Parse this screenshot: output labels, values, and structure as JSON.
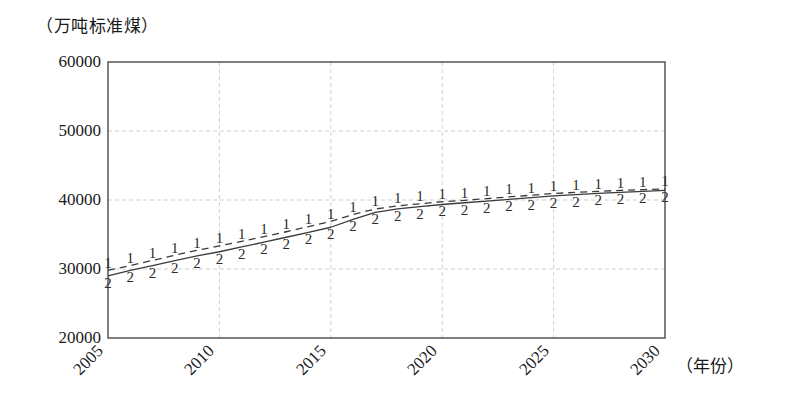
{
  "chart_data": {
    "type": "line",
    "title": "",
    "subtitle": "",
    "ylabel": "（万吨标准煤）",
    "xlabel": "（年份）",
    "xlim": [
      2005,
      2030
    ],
    "ylim": [
      20000,
      60000
    ],
    "yticks": [
      20000,
      30000,
      40000,
      50000,
      60000
    ],
    "ytick_labels": [
      "20000",
      "30000",
      "40000",
      "50000",
      "60000"
    ],
    "xticks": [
      2005,
      2010,
      2015,
      2020,
      2025,
      2030
    ],
    "xtick_labels": [
      "2005",
      "2010",
      "2015",
      "2020",
      "2025",
      "2030"
    ],
    "grid": {
      "horizontal": true,
      "vertical": true,
      "style": "dashed",
      "color": "#c9c9c9"
    },
    "legend": {
      "visible": false,
      "position": "none"
    },
    "annotations": [],
    "x": [
      2005,
      2006,
      2007,
      2008,
      2009,
      2010,
      2011,
      2012,
      2013,
      2014,
      2015,
      2016,
      2017,
      2018,
      2019,
      2020,
      2021,
      2022,
      2023,
      2024,
      2025,
      2026,
      2027,
      2028,
      2029,
      2030
    ],
    "series": [
      {
        "name": "1",
        "marker": "1",
        "linestyle": "dashed",
        "color": "#3a3a3a",
        "values": [
          29800,
          30500,
          31250,
          32000,
          32700,
          33350,
          34000,
          34700,
          35400,
          36150,
          36900,
          37900,
          38700,
          39150,
          39450,
          39750,
          39950,
          40200,
          40450,
          40700,
          40950,
          41100,
          41250,
          41400,
          41500,
          41600
        ]
      },
      {
        "name": "2",
        "marker": "2",
        "linestyle": "solid",
        "color": "#3a3a3a",
        "values": [
          29000,
          29800,
          30500,
          31200,
          31900,
          32500,
          33200,
          33900,
          34600,
          35300,
          36050,
          37200,
          38200,
          38700,
          39050,
          39350,
          39600,
          39850,
          40100,
          40350,
          40600,
          40780,
          40950,
          41100,
          41250,
          41400
        ]
      }
    ]
  },
  "axes_geometry": {
    "plot_left_px": 108,
    "plot_right_px": 665,
    "plot_top_px": 62,
    "plot_bottom_px": 338
  }
}
